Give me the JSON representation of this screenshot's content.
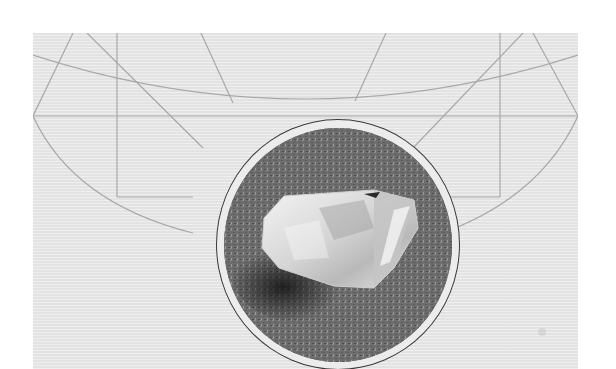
{
  "image": {
    "description": "Black-and-white photograph of a clear quartz crystal resting on a textured grey surface, shown inside a circular medallion frame over a light grey panel decorated with thin geometric arc and line pattern",
    "subject": "quartz crystal",
    "style": "monochrome"
  },
  "colors": {
    "page_background": "#ffffff",
    "panel_background": "#e7e7e7",
    "pattern_lines": "#a8a8a8",
    "medallion_ring": "#3a3a3a",
    "photo_surface": "#6e6e6e",
    "crystal_highlight": "#f2f2f2"
  }
}
